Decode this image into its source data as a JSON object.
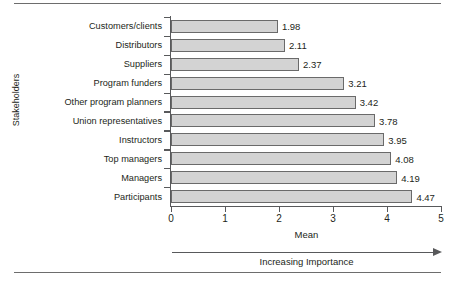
{
  "chart_data": {
    "type": "bar",
    "orientation": "horizontal",
    "title": "",
    "xlabel": "Mean",
    "ylabel": "Stakeholders",
    "xlim": [
      0,
      5
    ],
    "xticks": [
      "0",
      "1",
      "2",
      "3",
      "4",
      "5"
    ],
    "grid": false,
    "legend": null,
    "categories": [
      "Customers/clients",
      "Distributors",
      "Suppliers",
      "Program funders",
      "Other program planners",
      "Union representatives",
      "Instructors",
      "Top managers",
      "Managers",
      "Participants"
    ],
    "values": [
      1.98,
      2.11,
      2.37,
      3.21,
      3.42,
      3.78,
      3.95,
      4.08,
      4.19,
      4.47
    ],
    "value_labels": [
      "1.98",
      "2.11",
      "2.37",
      "3.21",
      "3.42",
      "3.78",
      "3.95",
      "4.08",
      "4.19",
      "4.47"
    ],
    "annotations": [
      {
        "text": "Increasing Importance",
        "type": "axis-direction-arrow"
      }
    ],
    "colors": {
      "bar_fill": "#d3d3d3",
      "bar_border": "#6a6a6a",
      "axis": "#58595b",
      "text": "#231f20",
      "rule": "#6d6d6d",
      "background": "#ffffff"
    }
  }
}
